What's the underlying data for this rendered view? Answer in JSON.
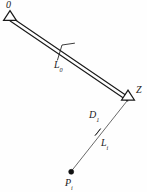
{
  "figure": {
    "kind": "survey-network-diagram",
    "width": 147,
    "height": 192,
    "background_color": "#fefefe",
    "ink_color": "#1a1a1a"
  },
  "labels": {
    "station_origin": "0",
    "station_z": "Z",
    "baseline": "L",
    "baseline_sub": "0",
    "distance": "D",
    "distance_sub": "1",
    "leg": "L",
    "leg_sub": "i",
    "point": "P",
    "point_sub": "i"
  },
  "geometry": {
    "station_origin": {
      "x": 10,
      "y": 19
    },
    "station_z": {
      "x": 128,
      "y": 99
    },
    "point_pi": {
      "x": 71,
      "y": 172
    },
    "baseline_offset": 2.2,
    "arrow_on_leg_at": {
      "x": 98,
      "y": 132
    },
    "leader_bend": {
      "x": 58,
      "y": 47
    },
    "leader_tip": {
      "x": 73,
      "y": 43
    }
  }
}
